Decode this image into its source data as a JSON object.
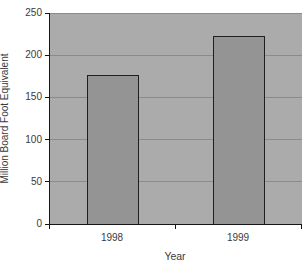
{
  "chart_data": {
    "type": "bar",
    "title": "",
    "categories": [
      "1998",
      "1999"
    ],
    "values": [
      177,
      223
    ],
    "xlabel": "Year",
    "ylabel": "Million Board Foot Equivalent",
    "ylim": [
      0,
      250
    ],
    "yticks": [
      0,
      50,
      100,
      150,
      200,
      250
    ],
    "grid": "horizontal",
    "legend": "none",
    "colors": {
      "page_background": "#ffffff",
      "plot_background": "#ababab",
      "bar_fill": "#949494",
      "bar_border": "#1f1f1f",
      "gridline": "#8b8b8b",
      "axis": "#151515",
      "text": "#3a3a3a"
    }
  }
}
